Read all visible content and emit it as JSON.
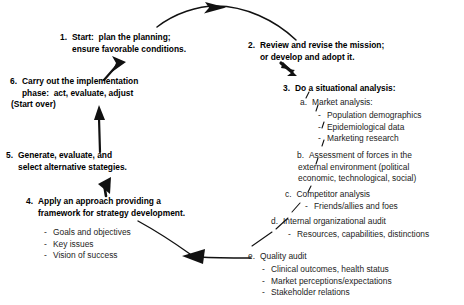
{
  "diagram": {
    "type": "cycle-flow",
    "ink_color": "#111111",
    "background": "#ffffff",
    "steps": [
      {
        "id": "step-1",
        "marker": "1.",
        "lines": [
          "Start:  plan the planning;",
          "ensure favorable conditions."
        ]
      },
      {
        "id": "step-2",
        "marker": "2.",
        "lines": [
          "Review and revise the mission;",
          "or develop and adopt it."
        ]
      },
      {
        "id": "step-3",
        "marker": "3.",
        "lines": [
          "Do a situational analysis:"
        ]
      },
      {
        "id": "step-4",
        "marker": "4.",
        "lines": [
          "Apply an approach providing a",
          "framework for strategy development."
        ]
      },
      {
        "id": "step-5",
        "marker": "5.",
        "lines": [
          "Generate, evaluate, and",
          "select alternative stategies."
        ]
      },
      {
        "id": "step-6",
        "marker": "6.",
        "lines": [
          "Carry out the implementation",
          "phase:  act, evaluate, adjust",
          "(Start over)"
        ]
      }
    ],
    "step4_bullets": [
      "Goals and objectives",
      "Key issues",
      "Vision of success"
    ],
    "substeps": [
      {
        "id": "substep-a",
        "marker": "a.",
        "lines": [
          "Market analysis:"
        ],
        "bullets": [
          "Population demographics",
          "Epidemiological data",
          "Marketing research"
        ]
      },
      {
        "id": "substep-b",
        "marker": "b.",
        "lines": [
          "Assessment of forces in the",
          "external environment (political",
          "economic, technological, social)"
        ],
        "bullets": []
      },
      {
        "id": "substep-c",
        "marker": "c.",
        "lines": [
          "Competitor analysis"
        ],
        "bullets": [
          "Friends/allies and foes"
        ]
      },
      {
        "id": "substep-d",
        "marker": "d.",
        "lines": [
          "Internal organizational audit"
        ],
        "bullets": [
          "Resources, capabilities, distinctions"
        ]
      },
      {
        "id": "substep-e",
        "marker": "e.",
        "lines": [
          "Quality audit"
        ],
        "bullets": [
          "Clinical outcomes, health status",
          "Market perceptions/expectations",
          "Stakeholder relations"
        ]
      }
    ],
    "bullet_dash": "-"
  }
}
